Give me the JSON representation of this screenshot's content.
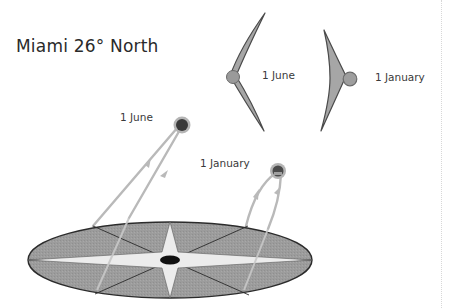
{
  "diagram": {
    "title": "Miami 26° North",
    "labels": {
      "sun_june": "1 June",
      "sun_january": "1 January",
      "shadow_june": "1 June",
      "shadow_january": "1 January"
    },
    "colors": {
      "disc_fill": "#9a9a9a",
      "disc_stroke": "#2b2b2b",
      "star_fill": "#ececec",
      "sun_path": "#b9b9b9",
      "sun_dark": "#3a3a3a",
      "sun_halo": "#9e9e9e",
      "shadow_fill": "#a6a6a6",
      "shadow_stroke": "#4a4a4a",
      "text": "#3a3a3a"
    }
  }
}
